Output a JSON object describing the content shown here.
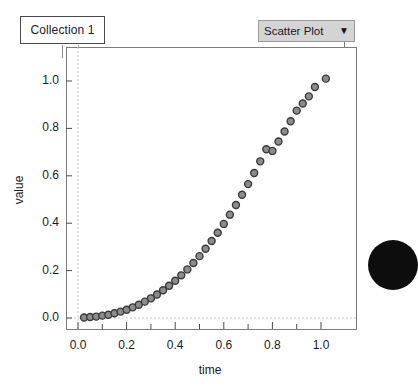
{
  "collection": {
    "name": "Collection 1"
  },
  "plot_type_dropdown": {
    "selected": "Scatter Plot",
    "caret": "▼"
  },
  "chart_data": {
    "type": "scatter",
    "title": "",
    "xlabel": "time",
    "ylabel": "value",
    "xlim": [
      -0.04,
      1.1
    ],
    "ylim": [
      -0.05,
      1.08
    ],
    "grid": false,
    "zero_gridlines": true,
    "xticks": [
      0.0,
      0.1,
      0.2,
      0.3,
      0.4,
      0.5,
      0.6,
      0.7,
      0.8,
      0.9,
      1.0
    ],
    "xtick_labels": [
      "0.0",
      "",
      "0.2",
      "",
      "0.4",
      "",
      "0.6",
      "",
      "0.8",
      "",
      "1.0"
    ],
    "yticks": [
      0.0,
      0.2,
      0.4,
      0.6,
      0.8,
      1.0
    ],
    "ytick_labels": [
      "0.0",
      "0.2",
      "0.4",
      "0.6",
      "0.8",
      "1.0"
    ],
    "marker": {
      "shape": "circle",
      "size": 7,
      "fill": "#8c8c8c",
      "edge": "#3a3a3a"
    },
    "points": [
      {
        "x": 0.025,
        "y": 0.002
      },
      {
        "x": 0.05,
        "y": 0.004
      },
      {
        "x": 0.075,
        "y": 0.006
      },
      {
        "x": 0.1,
        "y": 0.01
      },
      {
        "x": 0.125,
        "y": 0.014
      },
      {
        "x": 0.15,
        "y": 0.02
      },
      {
        "x": 0.175,
        "y": 0.027
      },
      {
        "x": 0.2,
        "y": 0.035
      },
      {
        "x": 0.225,
        "y": 0.045
      },
      {
        "x": 0.25,
        "y": 0.056
      },
      {
        "x": 0.275,
        "y": 0.069
      },
      {
        "x": 0.3,
        "y": 0.083
      },
      {
        "x": 0.325,
        "y": 0.099
      },
      {
        "x": 0.35,
        "y": 0.117
      },
      {
        "x": 0.375,
        "y": 0.136
      },
      {
        "x": 0.4,
        "y": 0.157
      },
      {
        "x": 0.425,
        "y": 0.18
      },
      {
        "x": 0.45,
        "y": 0.205
      },
      {
        "x": 0.475,
        "y": 0.232
      },
      {
        "x": 0.5,
        "y": 0.261
      },
      {
        "x": 0.525,
        "y": 0.292
      },
      {
        "x": 0.55,
        "y": 0.325
      },
      {
        "x": 0.575,
        "y": 0.36
      },
      {
        "x": 0.6,
        "y": 0.397
      },
      {
        "x": 0.625,
        "y": 0.436
      },
      {
        "x": 0.65,
        "y": 0.477
      },
      {
        "x": 0.675,
        "y": 0.52
      },
      {
        "x": 0.7,
        "y": 0.565
      },
      {
        "x": 0.725,
        "y": 0.612
      },
      {
        "x": 0.75,
        "y": 0.661
      },
      {
        "x": 0.775,
        "y": 0.712
      },
      {
        "x": 0.8,
        "y": 0.705
      },
      {
        "x": 0.825,
        "y": 0.745
      },
      {
        "x": 0.85,
        "y": 0.787
      },
      {
        "x": 0.875,
        "y": 0.83
      },
      {
        "x": 0.9,
        "y": 0.875
      },
      {
        "x": 0.925,
        "y": 0.905
      },
      {
        "x": 0.95,
        "y": 0.935
      },
      {
        "x": 0.975,
        "y": 0.975
      },
      {
        "x": 1.02,
        "y": 1.01
      }
    ]
  }
}
